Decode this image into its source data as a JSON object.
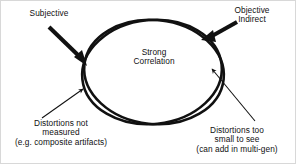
{
  "diagram": {
    "type": "venn-overlap-annotated",
    "canvas": {
      "width": 296,
      "height": 164,
      "background": "#ffffff",
      "border_color": "#d8d8d8"
    },
    "stroke_color": "#111111",
    "text_color": "#111111",
    "center_label": {
      "name": "strong-correlation-label",
      "lines": [
        "Strong",
        "Correlation"
      ]
    },
    "annotations": [
      {
        "name": "subjective",
        "lines": [
          "Subjective"
        ],
        "arrow": "thick",
        "position": "top-left"
      },
      {
        "name": "objective-indirect",
        "lines": [
          "Objective",
          "Indirect"
        ],
        "arrow": "thick",
        "position": "top-right"
      },
      {
        "name": "distortions-not-measured",
        "lines": [
          "Distortions not",
          "measured",
          "(e.g. composite artifacts)"
        ],
        "arrow": "thin",
        "position": "bottom-left"
      },
      {
        "name": "distortions-too-small",
        "lines": [
          "Distortions too",
          "small to see",
          "(can add in multi-gen)"
        ],
        "arrow": "thin",
        "position": "bottom-right"
      }
    ],
    "shapes": {
      "ellipse_a": {
        "cx": 151,
        "cy": 71,
        "rx": 70,
        "ry": 52,
        "rotation_deg": -6
      },
      "ellipse_b": {
        "cx": 153,
        "cy": 71,
        "rx": 70,
        "ry": 52,
        "rotation_deg": 6
      }
    }
  }
}
